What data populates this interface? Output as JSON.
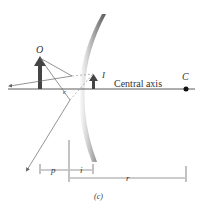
{
  "figure": {
    "object_label": "O",
    "image_label": "I",
    "center_label": "C",
    "focal_label": "c",
    "axis_label": "Central axis",
    "p_label": "p",
    "i_label": "i",
    "r_label": "r",
    "caption": "(c)",
    "mirror_type": "convex",
    "colors": {
      "arrow": "#444444",
      "ray": "#666666",
      "mirror_shade": "#777777"
    }
  }
}
